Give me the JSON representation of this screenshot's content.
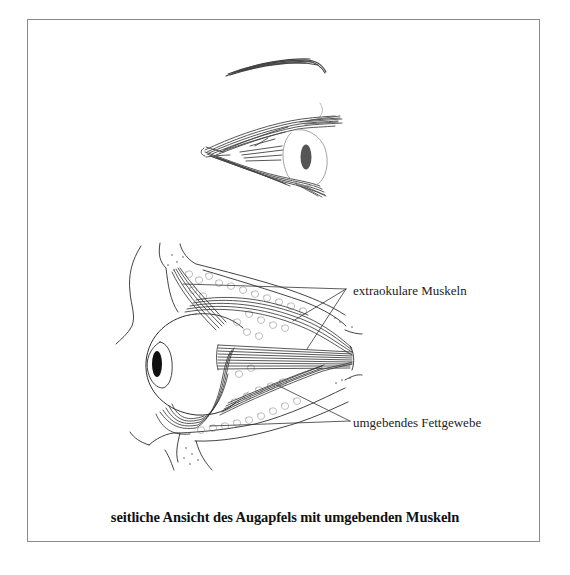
{
  "figure": {
    "top_illustration": "Seitenansicht des Auges mit Augenbraue und Muskeln (Skizze)",
    "bottom_illustration": "Querschnitt: Augapfel in der Augenhöhle mit Muskeln und Fettgewebe",
    "labels": {
      "muscles": "extraokulare Muskeln",
      "fat": "umgebendes Fettgewebe"
    },
    "caption": "seitliche Ansicht des Augapfels mit umgebenden Muskeln"
  },
  "colors": {
    "line": "#333333",
    "frame": "#8a8a8a",
    "pupil": "#1a1a1a",
    "background": "#ffffff"
  }
}
